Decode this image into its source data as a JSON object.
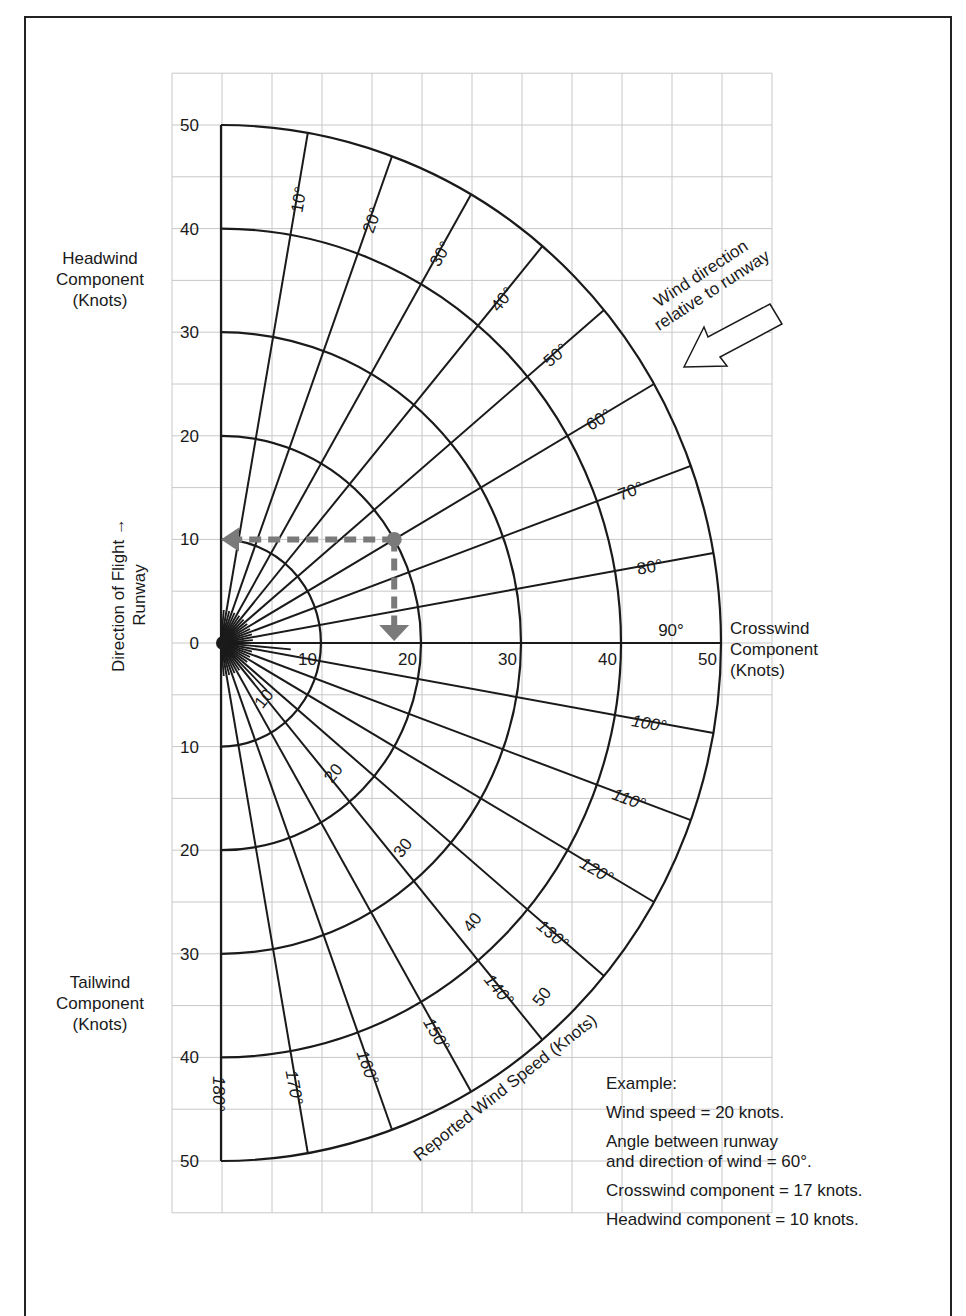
{
  "chart_data": {
    "type": "polar-wind-component-chart",
    "title": "",
    "origin_label": "0",
    "headwind_axis": {
      "label_lines": [
        "Headwind",
        "Component",
        "(Knots)"
      ],
      "ticks": [
        50,
        40,
        30,
        20,
        10,
        0
      ]
    },
    "tailwind_axis": {
      "label_lines": [
        "Tailwind",
        "Component",
        "(Knots)"
      ],
      "ticks": [
        10,
        20,
        30,
        40,
        50
      ]
    },
    "crosswind_axis": {
      "label_lines": [
        "Crosswind",
        "Component",
        "(Knots)"
      ],
      "ticks": [
        10,
        20,
        30,
        40,
        50
      ]
    },
    "runway_axis": {
      "label_line1": "Direction of Flight →",
      "label_line2": "Runway"
    },
    "wind_speed_arcs": {
      "label": "Reported Wind Speed (Knots)",
      "radii": [
        10,
        20,
        30,
        40,
        50
      ],
      "inline_labels": [
        "10",
        "20",
        "30",
        "40",
        "50"
      ]
    },
    "radial_angles_deg": [
      10,
      20,
      30,
      40,
      50,
      60,
      70,
      80,
      90,
      100,
      110,
      120,
      130,
      140,
      150,
      160,
      170,
      180
    ],
    "angle_labels": [
      "10°",
      "20°",
      "30°",
      "40°",
      "50°",
      "60°",
      "70°",
      "80°",
      "90°",
      "100°",
      "110°",
      "120°",
      "130°",
      "140°",
      "150°",
      "160°",
      "170°",
      "180°"
    ],
    "wind_direction_annotation": [
      "Wind direction",
      "relative to runway"
    ],
    "example_point": {
      "wind_speed": 20,
      "angle_deg": 60,
      "crosswind": 17,
      "headwind": 10
    },
    "grid": true,
    "xlim": [
      -5,
      55
    ],
    "ylim": [
      -55,
      55
    ]
  },
  "example": {
    "title": "Example:",
    "lines": [
      "Wind speed = 20 knots.",
      "Angle between runway",
      "and direction of wind = 60°.",
      "Crosswind component = 17 knots.",
      "Headwind component = 10 knots."
    ]
  },
  "colors": {
    "ink": "#1a1a1a",
    "grid": "#c8c8c8",
    "example_path": "#7a7a7a"
  }
}
